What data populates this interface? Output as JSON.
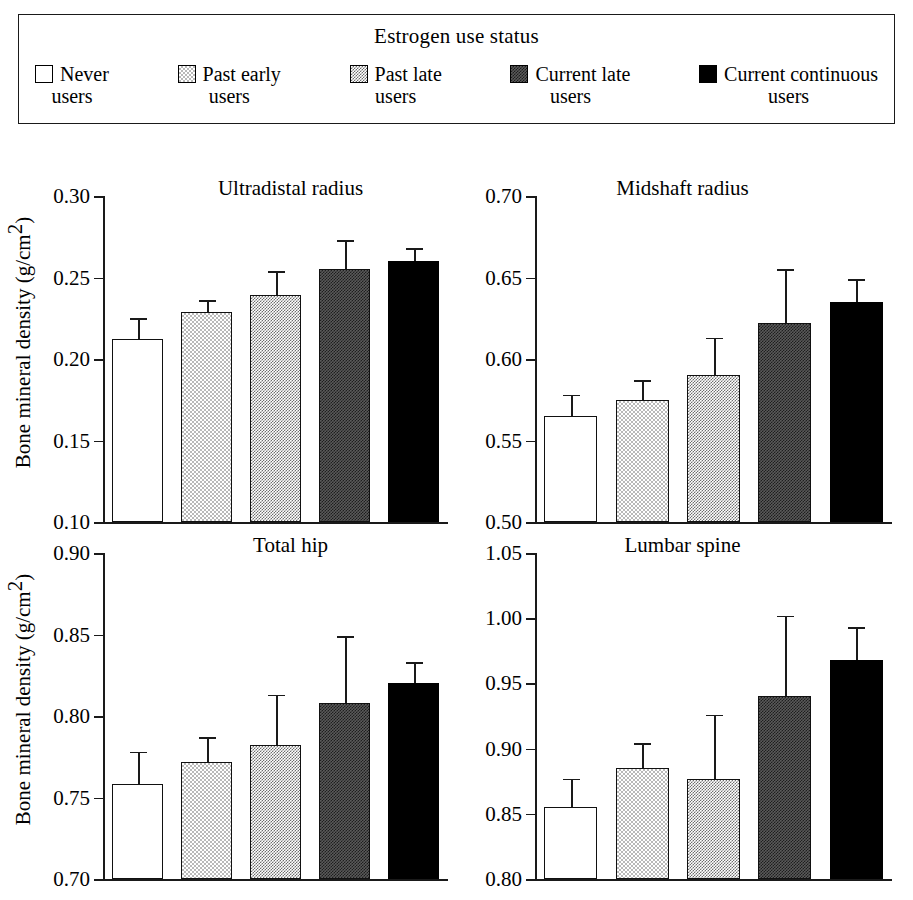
{
  "figure": {
    "legend": {
      "title": "Estrogen use status",
      "items": [
        {
          "label_line1": "Never",
          "label_line2": "users",
          "pattern": "none",
          "swatch_name": "swatch-never-users"
        },
        {
          "label_line1": "Past early",
          "label_line2": "users",
          "pattern": "light",
          "swatch_name": "swatch-past-early-users"
        },
        {
          "label_line1": "Past late",
          "label_line2": "users",
          "pattern": "mid",
          "swatch_name": "swatch-past-late-users"
        },
        {
          "label_line1": "Current late",
          "label_line2": "users",
          "pattern": "dark",
          "swatch_name": "swatch-current-late-users"
        },
        {
          "label_line1": "Current continuous",
          "label_line2": "users",
          "pattern": "solid",
          "swatch_name": "swatch-current-continuous-users"
        }
      ]
    },
    "ylabel_text": "Bone mineral density (g/cm",
    "ylabel_sup": "2",
    "ylabel_close": ")"
  },
  "chart_data": [
    {
      "id": "ultradistal-radius",
      "type": "bar",
      "title": "Ultradistal radius",
      "xlabel": "",
      "ylabel": "Bone mineral density (g/cm2)",
      "ylim": [
        0.1,
        0.3
      ],
      "yticks": [
        0.1,
        0.15,
        0.2,
        0.25,
        0.3
      ],
      "ytick_labels": [
        "0.10",
        "0.15",
        "0.20",
        "0.25",
        "0.30"
      ],
      "grid": false,
      "legend_position": "top-external",
      "categories": [
        "Never users",
        "Past early users",
        "Past late users",
        "Current late users",
        "Current continuous users"
      ],
      "values": [
        0.212,
        0.229,
        0.239,
        0.255,
        0.26
      ],
      "errors_upper": [
        0.225,
        0.236,
        0.254,
        0.273,
        0.268
      ]
    },
    {
      "id": "midshaft-radius",
      "type": "bar",
      "title": "Midshaft radius",
      "xlabel": "",
      "ylabel": "",
      "ylim": [
        0.5,
        0.7
      ],
      "yticks": [
        0.5,
        0.55,
        0.6,
        0.65,
        0.7
      ],
      "ytick_labels": [
        "0.50",
        "0.55",
        "0.60",
        "0.65",
        "0.70"
      ],
      "grid": false,
      "legend_position": "top-external",
      "categories": [
        "Never users",
        "Past early users",
        "Past late users",
        "Current late users",
        "Current continuous users"
      ],
      "values": [
        0.565,
        0.575,
        0.59,
        0.622,
        0.635
      ],
      "errors_upper": [
        0.578,
        0.587,
        0.613,
        0.655,
        0.649
      ]
    },
    {
      "id": "total-hip",
      "type": "bar",
      "title": "Total hip",
      "xlabel": "",
      "ylabel": "Bone mineral density (g/cm2)",
      "ylim": [
        0.7,
        0.9
      ],
      "yticks": [
        0.7,
        0.75,
        0.8,
        0.85,
        0.9
      ],
      "ytick_labels": [
        "0.70",
        "0.75",
        "0.80",
        "0.85",
        "0.90"
      ],
      "grid": false,
      "legend_position": "top-external",
      "categories": [
        "Never users",
        "Past early users",
        "Past late users",
        "Current late users",
        "Current continuous users"
      ],
      "values": [
        0.758,
        0.772,
        0.782,
        0.808,
        0.82
      ],
      "errors_upper": [
        0.778,
        0.787,
        0.813,
        0.849,
        0.833
      ]
    },
    {
      "id": "lumbar-spine",
      "type": "bar",
      "title": "Lumbar spine",
      "xlabel": "",
      "ylabel": "",
      "ylim": [
        0.8,
        1.05
      ],
      "yticks": [
        0.8,
        0.85,
        0.9,
        0.95,
        1.0,
        1.05
      ],
      "ytick_labels": [
        "0.80",
        "0.85",
        "0.90",
        "0.95",
        "1.00",
        "1.05"
      ],
      "grid": false,
      "legend_position": "top-external",
      "categories": [
        "Never users",
        "Past early users",
        "Past late users",
        "Current late users",
        "Current continuous users"
      ],
      "values": [
        0.855,
        0.885,
        0.877,
        0.94,
        0.968
      ],
      "errors_upper": [
        0.877,
        0.904,
        0.926,
        1.002,
        0.993
      ]
    }
  ]
}
